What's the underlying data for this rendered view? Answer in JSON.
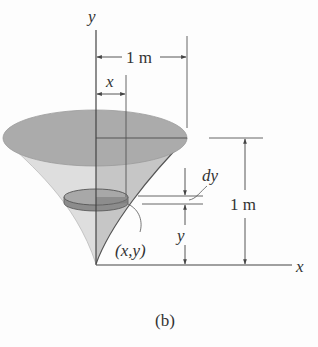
{
  "figure": {
    "caption": "(b)",
    "axes": {
      "y_label": "y",
      "x_label": "x"
    },
    "dimensions": {
      "radius_label": "1 m",
      "height_label": "1 m",
      "disk_radius_label": "x",
      "disk_height_label": "y",
      "disk_thickness_label": "dy",
      "point_label": "(x,y)"
    },
    "colors": {
      "cone_side": "#d4d4d4",
      "cone_inner": "#bdbdbd",
      "top_ellipse": "#a9a9a9",
      "disk_top": "#a3a3a3",
      "disk_band": "#7f7f7f",
      "line": "#4a4a4a"
    }
  }
}
